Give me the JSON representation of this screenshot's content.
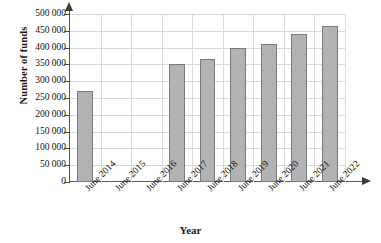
{
  "chart_data": {
    "type": "bar",
    "title": "",
    "xlabel": "Year",
    "ylabel": "Number of funds",
    "categories": [
      "June 2014",
      "June 2015",
      "June 2016",
      "June 2017",
      "June 2018",
      "June 2019",
      "June 2020",
      "June 2021",
      "June 2022"
    ],
    "values": [
      270000,
      null,
      null,
      350000,
      365000,
      398000,
      410000,
      440000,
      465000
    ],
    "ylim": [
      0,
      500000
    ],
    "ytick_values": [
      0,
      50000,
      100000,
      150000,
      200000,
      250000,
      300000,
      350000,
      400000,
      450000,
      500000
    ],
    "ytick_labels": [
      "0",
      "50 000",
      "100 000",
      "150 000",
      "200 000",
      "250 000",
      "300 000",
      "350 000",
      "400 000",
      "450 000",
      "500 000"
    ],
    "grid": true,
    "legend": false,
    "bar_color": "#b3b3b3",
    "bar_border_color": "#7a7a7a",
    "grid_color": "#d9d9d9",
    "axis_color": "#5a5a5a"
  }
}
